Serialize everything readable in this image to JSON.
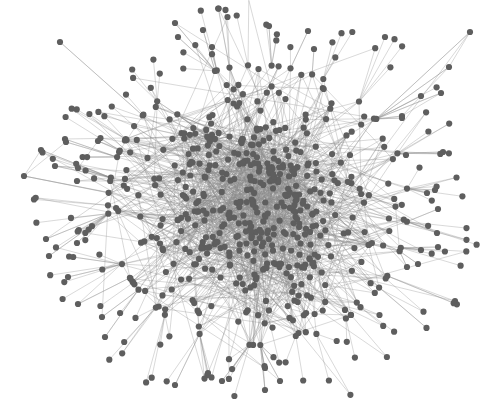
{
  "figure": {
    "type": "network-graph",
    "header_text_cropped": true
  },
  "style": {
    "background": "#ffffff",
    "node_color": "#5e5e5e",
    "node_radius": 3.1,
    "edge_color": "#8a8a8a",
    "edge_opacity": 0.55,
    "edge_width": 0.6
  },
  "layout": {
    "center": [
      258,
      205
    ],
    "core_radius_x": 150,
    "core_radius_y": 140,
    "seed": 7,
    "core_nodes": 520,
    "core_edges": 1300,
    "periphery_nodes": 120
  },
  "anchored_nodes": [
    [
      470,
      32
    ],
    [
      449,
      67
    ],
    [
      421,
      96
    ],
    [
      402,
      116
    ],
    [
      441,
      93
    ],
    [
      402,
      118
    ],
    [
      24,
      176
    ],
    [
      41,
      150
    ],
    [
      66,
      142
    ],
    [
      55,
      166
    ],
    [
      78,
      168
    ],
    [
      98,
      141
    ],
    [
      65,
      139
    ],
    [
      60,
      42
    ],
    [
      46,
      239
    ],
    [
      49,
      256
    ],
    [
      77,
      243
    ],
    [
      68,
      277
    ],
    [
      78,
      304
    ],
    [
      102,
      317
    ],
    [
      105,
      337
    ],
    [
      175,
      23
    ],
    [
      178,
      37
    ],
    [
      203,
      30
    ],
    [
      212,
      47
    ],
    [
      269,
      26
    ],
    [
      308,
      31
    ],
    [
      314,
      49
    ],
    [
      435,
      190
    ],
    [
      427,
      193
    ],
    [
      438,
      209
    ],
    [
      437,
      233
    ],
    [
      438,
      247
    ],
    [
      421,
      250
    ],
    [
      418,
      264
    ],
    [
      407,
      267
    ],
    [
      175,
      385
    ],
    [
      208,
      373
    ],
    [
      265,
      368
    ],
    [
      265,
      390
    ],
    [
      280,
      381
    ],
    [
      222,
      381
    ],
    [
      443,
      152
    ],
    [
      406,
      155
    ]
  ],
  "anchored_edges": [
    [
      0,
      1
    ],
    [
      1,
      2
    ],
    [
      2,
      3
    ],
    [
      3,
      4
    ],
    [
      6,
      7
    ],
    [
      6,
      8
    ],
    [
      9,
      10
    ],
    [
      10,
      11
    ],
    [
      8,
      12
    ]
  ]
}
